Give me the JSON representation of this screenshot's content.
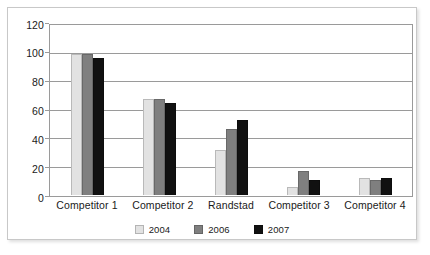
{
  "chart_data": {
    "type": "bar",
    "title": "",
    "subtitle": "",
    "xlabel": "",
    "ylabel": "",
    "categories": [
      "Competitor 1",
      "Competitor 2",
      "Randstad",
      "Competitor 3",
      "Competitor 4"
    ],
    "series": [
      {
        "name": "2004",
        "color": "#e2e2e2",
        "values": [
          100,
          68,
          32,
          6,
          12
        ]
      },
      {
        "name": "2006",
        "color": "#7f7f7f",
        "values": [
          100,
          68,
          47,
          17,
          11
        ]
      },
      {
        "name": "2007",
        "color": "#111111",
        "values": [
          97,
          65,
          53,
          11,
          12
        ]
      }
    ],
    "ylim": [
      0,
      120
    ],
    "yticks": [
      0,
      20,
      40,
      60,
      80,
      100,
      120
    ],
    "ytick_labels": [
      "0",
      "20",
      "40",
      "60",
      "80",
      "100",
      "120"
    ],
    "grid": true,
    "grid_axis": "y",
    "legend_position": "bottom",
    "plot_border": true,
    "background": "#ffffff",
    "border_color": "#9a9a9a"
  }
}
